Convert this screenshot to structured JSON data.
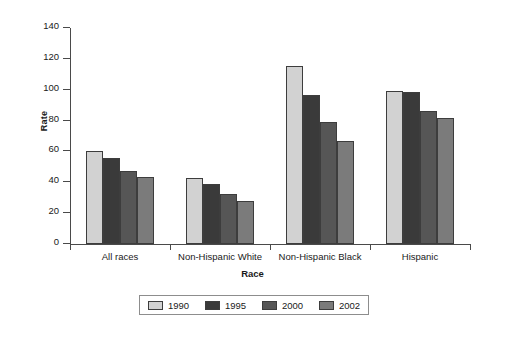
{
  "chart_data": {
    "type": "bar",
    "title": "",
    "xlabel": "Race",
    "ylabel": "Rate",
    "categories": [
      "All races",
      "Non-Hispanic White",
      "Non-Hispanic Black",
      "Hispanic"
    ],
    "series": [
      {
        "name": "1990",
        "color": "#d2d2d2",
        "values": [
          60,
          42.5,
          115.5,
          99
        ]
      },
      {
        "name": "1995",
        "color": "#3a3a3a",
        "values": [
          55.5,
          39,
          96.5,
          98.5
        ]
      },
      {
        "name": "2000",
        "color": "#565656",
        "values": [
          47.5,
          32.5,
          79,
          86
        ]
      },
      {
        "name": "2002",
        "color": "#7b7b7b",
        "values": [
          43.5,
          28,
          67,
          82
        ]
      }
    ],
    "ylim": [
      0,
      140
    ],
    "yticks": [
      0,
      20,
      40,
      60,
      80,
      100,
      120,
      140
    ],
    "ytick_labels": [
      "0",
      "20",
      "40",
      "60",
      "80",
      "100",
      "120",
      "140"
    ],
    "grid": false,
    "legend_position": "bottom"
  }
}
